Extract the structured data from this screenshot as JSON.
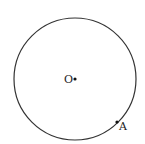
{
  "diagram": {
    "type": "geometry-circle",
    "circle": {
      "cx": 75,
      "cy": 79,
      "r": 61,
      "stroke": "#333333"
    },
    "points": [
      {
        "label": "O",
        "x": 75,
        "y": 79,
        "label_x": 64,
        "label_y": 83
      },
      {
        "label": "A",
        "x": 117,
        "y": 122,
        "label_x": 119,
        "label_y": 130
      }
    ]
  }
}
